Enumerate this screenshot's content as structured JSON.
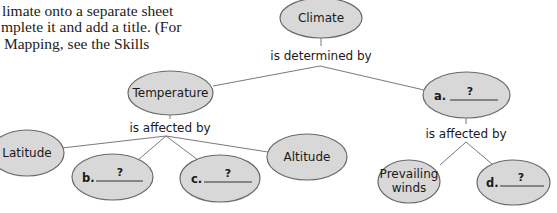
{
  "intro_text": {
    "lines": [
      "limate onto a separate sheet",
      "mplete it and add a title. (For",
      " Mapping, see the Skills"
    ]
  },
  "concept_map": {
    "root": {
      "label": "Climate"
    },
    "root_link": "is determined by",
    "temperature": {
      "label": "Temperature"
    },
    "temperature_link": "is affected by",
    "latitude": {
      "label": "Latitude"
    },
    "blank_b": {
      "letter": "b.",
      "placeholder": "?"
    },
    "blank_c": {
      "letter": "c.",
      "placeholder": "?"
    },
    "altitude": {
      "label": "Altitude"
    },
    "blank_a": {
      "letter": "a.",
      "placeholder": "?"
    },
    "a_link": "is affected by",
    "prevailing_winds": {
      "line1": "Prevailing",
      "line2": "winds"
    },
    "blank_d": {
      "letter": "d.",
      "placeholder": "?"
    }
  },
  "colors": {
    "node_fill": "#d8d8d8",
    "node_stroke": "#6a6a6a",
    "connector": "#7a7a7a",
    "text": "#1a1a1a"
  }
}
